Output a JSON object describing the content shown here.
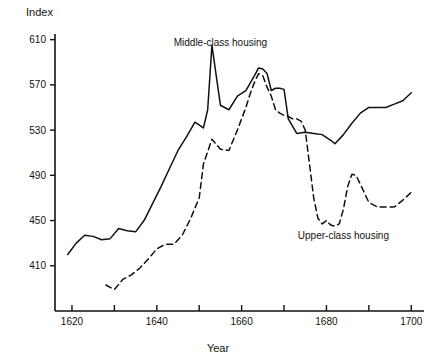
{
  "chart_data": {
    "type": "line",
    "title": "",
    "xlabel": "Year",
    "ylabel": "Index",
    "xlim": [
      1616,
      1703
    ],
    "ylim": [
      370,
      615
    ],
    "grid": false,
    "legend_position": "inline-annotations",
    "xticks": [
      1620,
      1630,
      1640,
      1650,
      1660,
      1670,
      1680,
      1690,
      1700
    ],
    "xtick_labels": [
      "1620",
      "",
      "1640",
      "",
      "1660",
      "",
      "1680",
      "",
      "1700"
    ],
    "yticks": [
      410,
      450,
      490,
      530,
      570,
      610
    ],
    "ytick_labels": [
      "410",
      "450",
      "490",
      "530",
      "570",
      "610"
    ],
    "annotations": [
      {
        "text": "Middle-class housing",
        "x": 1655,
        "y": 604
      },
      {
        "text": "Upper-class housing",
        "x": 1684,
        "y": 434
      }
    ],
    "series": [
      {
        "name": "Middle-class housing",
        "style": "solid",
        "color": "#111111",
        "x": [
          1619,
          1621,
          1623,
          1625,
          1627,
          1629,
          1631,
          1633,
          1635,
          1637,
          1639,
          1641,
          1643,
          1645,
          1647,
          1649,
          1651,
          1652,
          1653,
          1655,
          1657,
          1659,
          1661,
          1663,
          1664,
          1665,
          1666,
          1667,
          1668,
          1669,
          1670,
          1671,
          1673,
          1675,
          1677,
          1679,
          1681,
          1682,
          1684,
          1686,
          1688,
          1690,
          1692,
          1694,
          1696,
          1698,
          1700
        ],
        "values": [
          420,
          430,
          437,
          436,
          433,
          434,
          443,
          441,
          440,
          450,
          465,
          480,
          496,
          512,
          524,
          537,
          532,
          548,
          605,
          552,
          548,
          560,
          565,
          578,
          585,
          584,
          580,
          565,
          567,
          567,
          566,
          540,
          527,
          528,
          527,
          526,
          521,
          518,
          526,
          536,
          545,
          550,
          550,
          550,
          553,
          556,
          563
        ]
      },
      {
        "name": "Upper-class housing",
        "style": "dashed",
        "color": "#111111",
        "x": [
          1628,
          1630,
          1632,
          1634,
          1636,
          1638,
          1640,
          1642,
          1644,
          1646,
          1648,
          1650,
          1651,
          1653,
          1655,
          1657,
          1659,
          1661,
          1662,
          1663,
          1664,
          1665,
          1666,
          1667,
          1668,
          1669,
          1670,
          1671,
          1672,
          1673,
          1674,
          1675,
          1676,
          1677,
          1678,
          1679,
          1680,
          1681,
          1682,
          1683,
          1684,
          1685,
          1686,
          1687,
          1688,
          1690,
          1692,
          1694,
          1696,
          1698,
          1700
        ],
        "values": [
          393,
          389,
          398,
          402,
          408,
          416,
          425,
          429,
          429,
          437,
          452,
          470,
          500,
          522,
          513,
          512,
          530,
          550,
          562,
          572,
          580,
          578,
          568,
          560,
          548,
          545,
          543,
          542,
          540,
          540,
          538,
          530,
          500,
          470,
          452,
          447,
          450,
          446,
          445,
          447,
          460,
          480,
          491,
          490,
          482,
          466,
          462,
          462,
          462,
          468,
          475
        ]
      }
    ]
  }
}
